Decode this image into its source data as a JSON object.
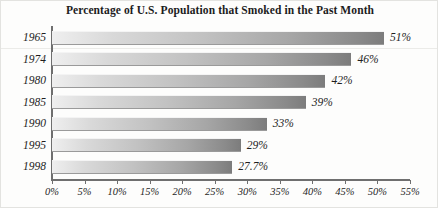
{
  "chart_data": {
    "type": "bar",
    "orientation": "horizontal",
    "title": "Percentage of U.S. Population that Smoked in the Past Month",
    "xlabel": "",
    "ylabel": "",
    "categories": [
      "1965",
      "1974",
      "1980",
      "1985",
      "1990",
      "1995",
      "1998"
    ],
    "values": [
      51,
      46,
      42,
      39,
      33,
      29,
      27.7
    ],
    "data_labels": [
      "51%",
      "46%",
      "42%",
      "39%",
      "33%",
      "29%",
      "27.7%"
    ],
    "xlim": [
      0,
      55
    ],
    "xticks": [
      0,
      5,
      10,
      15,
      20,
      25,
      30,
      35,
      40,
      45,
      50,
      55
    ],
    "xtick_labels": [
      "0%",
      "5%",
      "10%",
      "15%",
      "20%",
      "25%",
      "30%",
      "35%",
      "40%",
      "45%",
      "50%",
      "55%"
    ],
    "grid": false,
    "legend": null,
    "bar_fill_start_color": "#efefef",
    "bar_fill_end_color": "#7c7c7c",
    "axis_color": "#6f6f6f",
    "text_color": "#1f1f1f",
    "background_color": "#fdfdfc"
  }
}
